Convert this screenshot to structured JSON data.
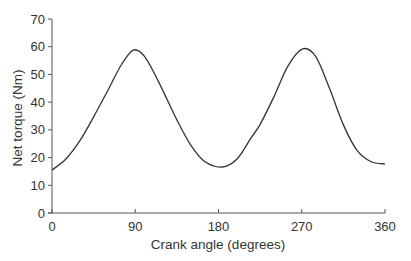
{
  "chart_data": {
    "type": "line",
    "title": "",
    "xlabel": "Crank angle (degrees)",
    "ylabel": "Net torque (Nm)",
    "xlim": [
      0,
      360
    ],
    "ylim": [
      0,
      70
    ],
    "x_ticks": [
      0,
      90,
      180,
      270,
      360
    ],
    "y_ticks": [
      0,
      10,
      20,
      30,
      40,
      50,
      60,
      70
    ],
    "grid": false,
    "legend": null,
    "series": [
      {
        "name": "Net torque",
        "color": "#333333",
        "x": [
          0,
          15,
          30,
          45,
          60,
          75,
          88,
          100,
          115,
          135,
          150,
          165,
          184,
          200,
          215,
          225,
          240,
          255,
          271,
          285,
          300,
          315,
          330,
          345,
          360
        ],
        "y": [
          15.5,
          19.5,
          26,
          34.7,
          44,
          53.5,
          58.8,
          56.5,
          47.5,
          33.6,
          24.5,
          18.6,
          16.6,
          19.5,
          27,
          32,
          42,
          53,
          59.2,
          56.5,
          45,
          31.8,
          22.5,
          18.5,
          17.7
        ]
      }
    ]
  }
}
